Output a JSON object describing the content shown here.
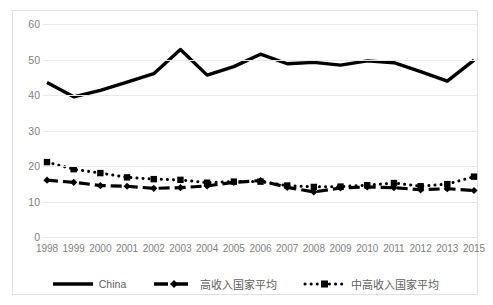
{
  "chart_data": {
    "type": "line",
    "title": "",
    "xlabel": "",
    "ylabel": "",
    "ylim": [
      0,
      60
    ],
    "yticks": [
      0,
      10,
      20,
      30,
      40,
      50,
      60
    ],
    "grid": true,
    "legend_position": "bottom",
    "categories": [
      "1998",
      "1999",
      "2000",
      "2001",
      "2002",
      "2003",
      "2004",
      "2005",
      "2006",
      "2007",
      "2008",
      "2009",
      "2010",
      "2011",
      "2012",
      "2013",
      "2015"
    ],
    "series": [
      {
        "name": "China",
        "style": "solid",
        "marker": "none",
        "color": "#000000",
        "values": [
          43.5,
          39.5,
          41.3,
          43.6,
          46.0,
          52.8,
          45.6,
          48.0,
          51.5,
          48.8,
          49.2,
          48.4,
          49.6,
          49.1,
          46.6,
          43.9,
          49.8
        ]
      },
      {
        "name": "高收入国家平均",
        "style": "dashed",
        "marker": "diamond",
        "color": "#000000",
        "values": [
          16.0,
          15.4,
          14.5,
          14.3,
          13.7,
          13.9,
          14.4,
          15.4,
          15.9,
          14.0,
          12.7,
          13.8,
          14.1,
          13.9,
          13.3,
          13.6,
          13.1
        ]
      },
      {
        "name": "中高收入国家平均",
        "style": "dotted",
        "marker": "square",
        "color": "#000000",
        "values": [
          21.1,
          19.1,
          18.0,
          16.8,
          16.3,
          16.1,
          15.3,
          15.6,
          15.6,
          14.5,
          14.1,
          14.2,
          14.6,
          15.2,
          14.3,
          14.9,
          17.0
        ]
      }
    ]
  },
  "axes": {
    "y_tick_labels": [
      "60",
      "50",
      "40",
      "30",
      "20",
      "10",
      "0"
    ],
    "x_tick_labels": [
      "1998",
      "1999",
      "2000",
      "2001",
      "2002",
      "2003",
      "2004",
      "2005",
      "2006",
      "2007",
      "2008",
      "2009",
      "2010",
      "2011",
      "2012",
      "2013",
      "2015"
    ]
  },
  "legend": {
    "entries": [
      {
        "label": "China",
        "swatch": "solid-line-swatch"
      },
      {
        "label": "高收入国家平均",
        "swatch": "dashed-diamond-swatch"
      },
      {
        "label": "中高收入国家平均",
        "swatch": "dotted-square-swatch"
      }
    ]
  },
  "colors": {
    "series_line": "#000000",
    "gridline": "#e8e8e8",
    "axis_text": "#808080",
    "frame": "#e2e2e2",
    "background": "#ffffff"
  }
}
